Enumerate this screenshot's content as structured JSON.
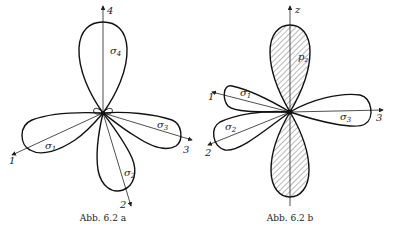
{
  "figures": [
    {
      "id": "a",
      "caption": "Abb. 6.2 a",
      "axes": [
        {
          "label": "4"
        },
        {
          "label": "1"
        },
        {
          "label": "2"
        },
        {
          "label": "3"
        }
      ],
      "lobes": [
        {
          "label": "σ",
          "sub": "4"
        },
        {
          "label": "σ",
          "sub": "1"
        },
        {
          "label": "σ",
          "sub": "2"
        },
        {
          "label": "σ",
          "sub": "3"
        }
      ]
    },
    {
      "id": "b",
      "caption": "Abb. 6.2 b",
      "axes": [
        {
          "label": "z"
        },
        {
          "label": "1"
        },
        {
          "label": "2"
        },
        {
          "label": "3"
        }
      ],
      "lobes": [
        {
          "label": "p",
          "sub": "z"
        },
        {
          "label": "σ",
          "sub": "1"
        },
        {
          "label": "σ",
          "sub": "2"
        },
        {
          "label": "σ",
          "sub": "3"
        }
      ]
    }
  ],
  "colors": {
    "ink": "#111111",
    "background": "#ffffff"
  }
}
